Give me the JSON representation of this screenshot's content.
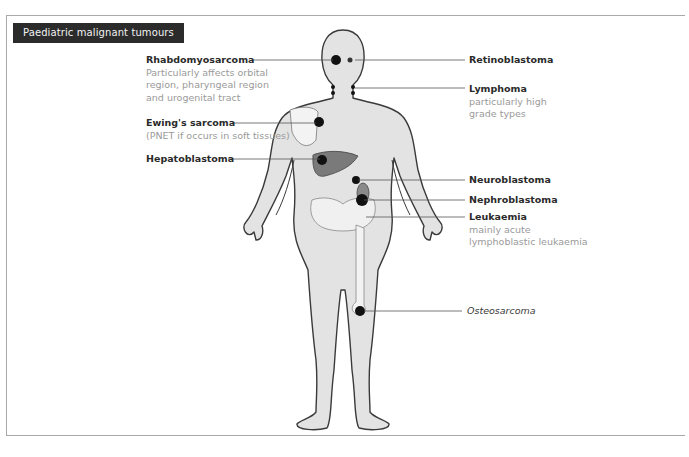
{
  "header": {
    "title": "Paediatric malignant tumours"
  },
  "labels_left": [
    {
      "title": "Rhabdomyosarcoma",
      "desc": [
        "Particularly affects orbital",
        "region, pharyngeal region",
        "and urogenital tract"
      ]
    },
    {
      "title": "Ewing's sarcoma",
      "desc": [
        "(PNET if occurs in soft tissues)"
      ]
    },
    {
      "title": "Hepatoblastoma",
      "desc": []
    }
  ],
  "labels_right": [
    {
      "title": "Retinoblastoma",
      "desc": []
    },
    {
      "title": "Lymphoma",
      "desc": [
        "particularly high",
        "grade types"
      ]
    },
    {
      "title": "Neuroblastoma",
      "desc": []
    },
    {
      "title": "Nephroblastoma",
      "desc": []
    },
    {
      "title": "Leukaemia",
      "desc": [
        "mainly acute",
        "lymphoblastic leukaemia"
      ]
    },
    {
      "title": "Osteosarcoma",
      "desc": []
    }
  ],
  "colors": {
    "header_bg": "#2b2b2b",
    "body_fill": "#e3e3e3",
    "outline": "#3a3a3a",
    "liver": "#7a7a7a",
    "tumour": "#111111",
    "leader_line": "#555555"
  }
}
